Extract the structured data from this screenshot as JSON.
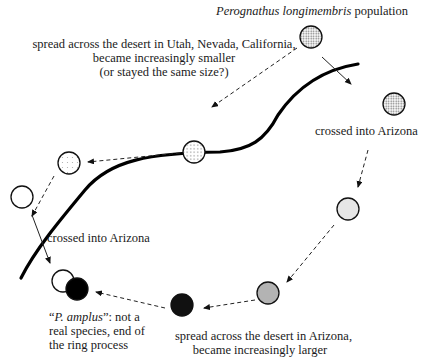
{
  "title": {
    "species_italic": "Perognathus longimembris",
    "suffix": " population"
  },
  "labels": {
    "west_spread": [
      "spread across the desert in Utah, Nevada, California,",
      "became increasingly smaller",
      "(or stayed the same size?)"
    ],
    "crossed_east": "crossed into Arizona",
    "crossed_west": "crossed into Arizona",
    "east_spread": [
      "spread across the desert in Arizona,",
      "became increasingly larger"
    ],
    "end": {
      "open_quote": "“",
      "italic": "P. amplus",
      "rest": "”: not a",
      "line2": "real species, end of",
      "line3": "the ring process"
    }
  },
  "populations": [
    {
      "id": "origin",
      "cx": 311,
      "cy": 37,
      "fill": "dense-dots"
    },
    {
      "id": "east-1",
      "cx": 394,
      "cy": 104,
      "fill": "dense-dots"
    },
    {
      "id": "east-2",
      "cx": 348,
      "cy": 209,
      "fill": "#e6e6e6"
    },
    {
      "id": "east-3",
      "cx": 268,
      "cy": 293,
      "fill": "#b3b3b3"
    },
    {
      "id": "east-4",
      "cx": 182,
      "cy": 305,
      "fill": "#111111"
    },
    {
      "id": "west-1",
      "cx": 194,
      "cy": 152,
      "fill": "medium-dots"
    },
    {
      "id": "west-2",
      "cx": 69,
      "cy": 163,
      "fill": "sparse-dots"
    },
    {
      "id": "west-3",
      "cx": 22,
      "cy": 197,
      "fill": "#ffffff"
    },
    {
      "id": "end-white",
      "cx": 63,
      "cy": 281,
      "fill": "#ffffff"
    },
    {
      "id": "end-black",
      "cx": 77,
      "cy": 289,
      "fill": "#000000"
    }
  ]
}
